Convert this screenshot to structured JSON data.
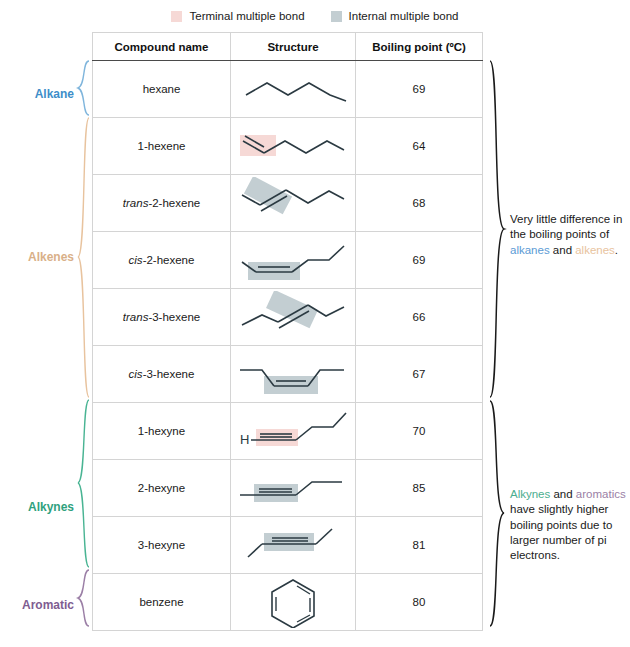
{
  "legend": {
    "items": [
      {
        "label": "Terminal multiple bond",
        "color": "#f6d9d6",
        "icon": "color-swatch"
      },
      {
        "label": "Internal multiple bond",
        "color": "#c3ced2",
        "icon": "color-swatch"
      }
    ]
  },
  "table": {
    "headers": [
      "Compound name",
      "Structure",
      "Boiling point (ºC)"
    ],
    "rows": [
      {
        "prefix": "",
        "name": "hexane",
        "full_name": "hexane",
        "bp": "69",
        "structure": "hexane-zigzag",
        "highlight": "none"
      },
      {
        "prefix": "",
        "name": "1-hexene",
        "full_name": "1-hexene",
        "bp": "64",
        "structure": "1-hexene-terminal-double",
        "highlight": "terminal"
      },
      {
        "prefix": "trans",
        "name": "-2-hexene",
        "full_name": "trans-2-hexene",
        "bp": "68",
        "structure": "trans-2-hexene-double",
        "highlight": "internal"
      },
      {
        "prefix": "cis",
        "name": "-2-hexene",
        "full_name": "cis-2-hexene",
        "bp": "69",
        "structure": "cis-2-hexene-double",
        "highlight": "internal"
      },
      {
        "prefix": "trans",
        "name": "-3-hexene",
        "full_name": "trans-3-hexene",
        "bp": "66",
        "structure": "trans-3-hexene-double",
        "highlight": "internal"
      },
      {
        "prefix": "cis",
        "name": "-3-hexene",
        "full_name": "cis-3-hexene",
        "bp": "67",
        "structure": "cis-3-hexene-double",
        "highlight": "internal"
      },
      {
        "prefix": "",
        "name": "1-hexyne",
        "full_name": "1-hexyne",
        "bp": "70",
        "structure": "1-hexyne-terminal-triple",
        "highlight": "terminal"
      },
      {
        "prefix": "",
        "name": "2-hexyne",
        "full_name": "2-hexyne",
        "bp": "85",
        "structure": "2-hexyne-triple",
        "highlight": "internal"
      },
      {
        "prefix": "",
        "name": "3-hexyne",
        "full_name": "3-hexyne",
        "bp": "81",
        "structure": "3-hexyne-triple",
        "highlight": "internal"
      },
      {
        "prefix": "",
        "name": "benzene",
        "full_name": "benzene",
        "bp": "80",
        "structure": "benzene-ring",
        "highlight": "none"
      }
    ]
  },
  "categories": [
    {
      "label": "Alkane",
      "color": "#3d8ec9"
    },
    {
      "label": "Alkenes",
      "color": "#d9b089"
    },
    {
      "label": "Alkynes",
      "color": "#2fa17e"
    },
    {
      "label": "Aromatic",
      "color": "#7e5d91"
    }
  ],
  "annotations": {
    "note_1": {
      "part_1": "Very little difference in the boiling points of ",
      "word_1": "alkanes",
      "part_2": " and ",
      "word_2": "alkenes",
      "part_3": "."
    },
    "note_2": {
      "word_1": "Alkynes",
      "part_1": " and ",
      "word_2": "aromatics",
      "part_2": " have slightly higher boiling points due to larger number of pi electrons."
    }
  },
  "colors": {
    "terminal_highlight": "#f6d9d6",
    "internal_highlight": "#c3ced2",
    "bond_line": "#2b3a42",
    "hydrogen_label": "H"
  },
  "structure_labels": {
    "hydrogen": "H"
  }
}
